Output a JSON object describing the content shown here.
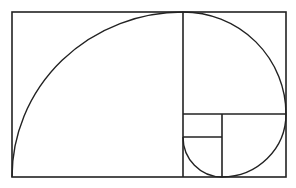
{
  "diagram": {
    "type": "golden-ratio-spiral",
    "stroke_color": "#222222",
    "background_color": "#ffffff",
    "outer_rect": {
      "x1": 12,
      "y1": 12,
      "x2": 286,
      "y2": 177
    },
    "dividers": [
      {
        "name": "main-vertical",
        "x1": 183,
        "y1": 12,
        "x2": 183,
        "y2": 177
      },
      {
        "name": "right-horizontal",
        "x1": 183,
        "y1": 114,
        "x2": 286,
        "y2": 114
      },
      {
        "name": "inner-vertical",
        "x1": 222,
        "y1": 114,
        "x2": 222,
        "y2": 177
      },
      {
        "name": "small-horizontal",
        "x1": 183,
        "y1": 137,
        "x2": 222,
        "y2": 137
      }
    ],
    "arcs": [
      {
        "name": "arc-large",
        "d": "M 12 177 A 171 165 0 0 1 183 12"
      },
      {
        "name": "arc-top-right",
        "d": "M 183 12 A 103 102 0 0 1 286 114"
      },
      {
        "name": "arc-bottom-right",
        "d": "M 286 114 A 64 63 0 0 1 222 177"
      },
      {
        "name": "arc-small",
        "d": "M 222 177 A 39 40 0 0 1 183 137"
      }
    ]
  }
}
